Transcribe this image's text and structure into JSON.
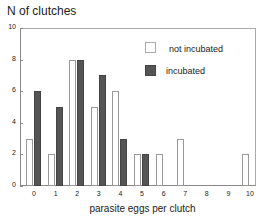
{
  "chart_data": {
    "type": "bar",
    "title": "",
    "ylabel": "N of clutches",
    "xlabel": "parasite eggs per clutch",
    "categories": [
      "0",
      "1",
      "2",
      "3",
      "4",
      "5",
      "6",
      "7",
      "8",
      "9",
      "10"
    ],
    "series": [
      {
        "name": "not incubated",
        "color": "#ffffff",
        "values": [
          3,
          2,
          8,
          5,
          6,
          2,
          2,
          3,
          0,
          0,
          2
        ]
      },
      {
        "name": "incubated",
        "color": "#555555",
        "values": [
          6,
          5,
          8,
          7,
          3,
          2,
          0,
          0,
          0,
          0,
          0
        ]
      }
    ],
    "ylim": [
      0,
      10
    ],
    "yticks": [
      "0",
      "2",
      "4",
      "6",
      "8",
      "10"
    ],
    "grid": false,
    "legend_position": "upper right"
  }
}
